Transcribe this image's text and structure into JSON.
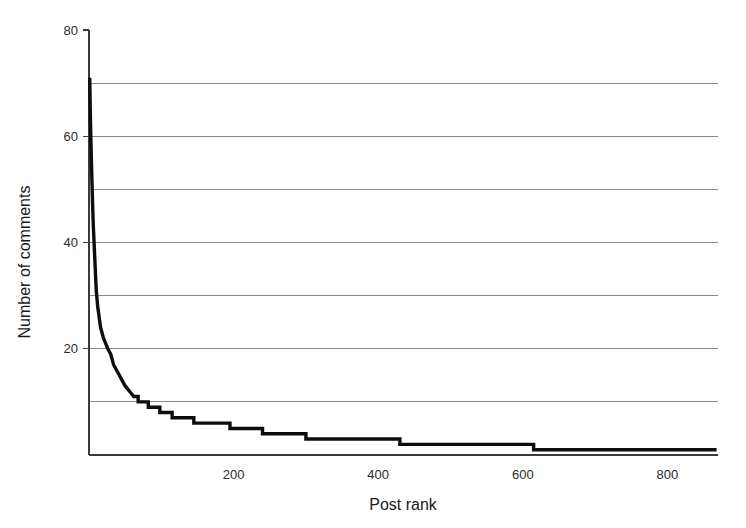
{
  "chart_data": {
    "type": "line",
    "title": "",
    "subtitle": "",
    "xlabel": "Post rank",
    "ylabel": "Number of comments",
    "xlim": [
      0,
      870
    ],
    "ylim": [
      0,
      80
    ],
    "grid": "horizontal",
    "legend": "none",
    "x_ticks": [
      200,
      400,
      600,
      800
    ],
    "x_tick_labels": [
      "200",
      "400",
      "600",
      "800"
    ],
    "y_ticks": [
      20,
      40,
      60,
      80
    ],
    "y_tick_labels": [
      "20",
      "40",
      "60",
      "80"
    ],
    "y_gridlines": [
      10,
      20,
      30,
      40,
      50,
      60,
      70
    ],
    "series": [
      {
        "name": "Number of comments per post",
        "color": "#0d0d0d",
        "line_width": 3.4,
        "x": [
          1,
          2,
          3,
          4,
          5,
          6,
          7,
          8,
          9,
          10,
          12,
          14,
          16,
          18,
          20,
          23,
          26,
          30,
          34,
          38,
          42,
          46,
          50,
          56,
          62,
          68,
          75,
          82,
          90,
          98,
          106,
          115,
          124,
          134,
          145,
          156,
          168,
          180,
          195,
          210,
          225,
          240,
          258,
          276,
          296,
          300,
          320,
          345,
          370,
          395,
          420,
          430,
          460,
          490,
          520,
          550,
          580,
          610,
          615,
          650,
          690,
          730,
          770,
          810,
          850,
          868
        ],
        "y": [
          71,
          63,
          57,
          52,
          47,
          43,
          40,
          37,
          34,
          31,
          28,
          26,
          24,
          23,
          22,
          21,
          20,
          19,
          17,
          16,
          15,
          14,
          13,
          12,
          11,
          10,
          10,
          9,
          9,
          8,
          8,
          7,
          7,
          7,
          6,
          6,
          6,
          6,
          5,
          5,
          5,
          4,
          4,
          4,
          4,
          3,
          3,
          3,
          3,
          3,
          3,
          2,
          2,
          2,
          2,
          2,
          2,
          2,
          1,
          1,
          1,
          1,
          1,
          1,
          1,
          1
        ]
      }
    ],
    "notes": {
      "max_value": 71,
      "min_value": 1,
      "total_posts": 868,
      "shape": "long-tail power-law decay"
    }
  },
  "axes": {
    "x_axis_title": "Post rank",
    "y_axis_title": "Number of comments"
  }
}
